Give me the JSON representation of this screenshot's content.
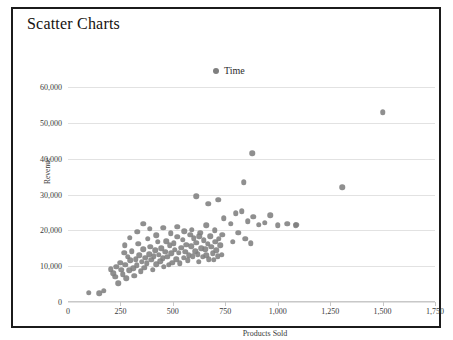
{
  "chart_panel": {
    "title": "Scatter Charts"
  },
  "legend": {
    "position": "top-center",
    "entries": [
      {
        "label": "Time",
        "color": "#7f7f7f"
      }
    ]
  },
  "chart_data": {
    "type": "scatter",
    "title": "Scatter Charts",
    "xlabel": "Products Sold",
    "ylabel": "Revenue",
    "xlim": [
      0,
      1750
    ],
    "ylim": [
      0,
      62000
    ],
    "xticks": [
      0,
      250,
      500,
      750,
      1000,
      1250,
      1500,
      1750
    ],
    "xticklabels": [
      "0",
      "250",
      "500",
      "750",
      "1,000",
      "1,250",
      "1,500",
      "1,750"
    ],
    "yticks": [
      0,
      10000,
      20000,
      30000,
      40000,
      50000,
      60000
    ],
    "yticklabels": [
      "0",
      "10,000",
      "20,000",
      "30,000",
      "40,000",
      "50,000",
      "60,000"
    ],
    "grid": "horizontal",
    "marker_color": "#808080",
    "series": [
      {
        "name": "Time",
        "points": [
          [
            100,
            2600
          ],
          [
            150,
            2400
          ],
          [
            170,
            3100
          ],
          [
            205,
            9200
          ],
          [
            215,
            8000
          ],
          [
            225,
            7000
          ],
          [
            230,
            9800
          ],
          [
            240,
            5200
          ],
          [
            248,
            11000
          ],
          [
            255,
            9000
          ],
          [
            262,
            7800
          ],
          [
            268,
            13800
          ],
          [
            272,
            10400
          ],
          [
            278,
            6600
          ],
          [
            285,
            12600
          ],
          [
            292,
            8800
          ],
          [
            298,
            11600
          ],
          [
            305,
            14200
          ],
          [
            310,
            9400
          ],
          [
            316,
            7400
          ],
          [
            322,
            12000
          ],
          [
            328,
            10200
          ],
          [
            334,
            16200
          ],
          [
            340,
            13000
          ],
          [
            346,
            8600
          ],
          [
            352,
            11200
          ],
          [
            358,
            14800
          ],
          [
            363,
            9600
          ],
          [
            369,
            12400
          ],
          [
            375,
            10800
          ],
          [
            381,
            17600
          ],
          [
            387,
            13400
          ],
          [
            392,
            15400
          ],
          [
            398,
            11800
          ],
          [
            404,
            9000
          ],
          [
            410,
            12800
          ],
          [
            416,
            14400
          ],
          [
            421,
            10600
          ],
          [
            427,
            16800
          ],
          [
            433,
            13200
          ],
          [
            439,
            11400
          ],
          [
            445,
            15000
          ],
          [
            451,
            12200
          ],
          [
            457,
            9800
          ],
          [
            463,
            14000
          ],
          [
            468,
            17000
          ],
          [
            474,
            12600
          ],
          [
            480,
            10400
          ],
          [
            486,
            15800
          ],
          [
            492,
            13600
          ],
          [
            498,
            11000
          ],
          [
            504,
            16400
          ],
          [
            510,
            14600
          ],
          [
            516,
            12000
          ],
          [
            522,
            18200
          ],
          [
            528,
            13800
          ],
          [
            534,
            10800
          ],
          [
            540,
            15200
          ],
          [
            546,
            17400
          ],
          [
            552,
            12400
          ],
          [
            558,
            14000
          ],
          [
            564,
            16000
          ],
          [
            570,
            11600
          ],
          [
            576,
            13000
          ],
          [
            582,
            18800
          ],
          [
            588,
            15600
          ],
          [
            594,
            12800
          ],
          [
            600,
            17800
          ],
          [
            606,
            14200
          ],
          [
            612,
            16600
          ],
          [
            618,
            13400
          ],
          [
            624,
            11200
          ],
          [
            630,
            19400
          ],
          [
            636,
            15000
          ],
          [
            642,
            12600
          ],
          [
            648,
            17200
          ],
          [
            654,
            14800
          ],
          [
            660,
            13000
          ],
          [
            666,
            16200
          ],
          [
            672,
            12000
          ],
          [
            678,
            18400
          ],
          [
            684,
            15400
          ],
          [
            690,
            13600
          ],
          [
            696,
            11800
          ],
          [
            702,
            16800
          ],
          [
            708,
            14400
          ],
          [
            714,
            12800
          ],
          [
            720,
            17600
          ],
          [
            726,
            15800
          ],
          [
            732,
            13200
          ],
          [
            270,
            15800
          ],
          [
            295,
            18000
          ],
          [
            330,
            19600
          ],
          [
            360,
            21800
          ],
          [
            390,
            20400
          ],
          [
            420,
            18600
          ],
          [
            455,
            20800
          ],
          [
            490,
            19200
          ],
          [
            520,
            21000
          ],
          [
            555,
            19800
          ],
          [
            590,
            20200
          ],
          [
            625,
            18400
          ],
          [
            660,
            21400
          ],
          [
            700,
            20000
          ],
          [
            735,
            18800
          ],
          [
            612,
            29600
          ],
          [
            668,
            27400
          ],
          [
            716,
            28600
          ],
          [
            742,
            23400
          ],
          [
            776,
            21800
          ],
          [
            800,
            24800
          ],
          [
            828,
            25400
          ],
          [
            856,
            22600
          ],
          [
            884,
            23800
          ],
          [
            910,
            21600
          ],
          [
            938,
            22200
          ],
          [
            964,
            24200
          ],
          [
            1000,
            21400
          ],
          [
            1046,
            21800
          ],
          [
            1088,
            21600
          ],
          [
            786,
            16800
          ],
          [
            812,
            19400
          ],
          [
            846,
            17600
          ],
          [
            872,
            16400
          ],
          [
            838,
            33400
          ],
          [
            878,
            41600
          ],
          [
            1085,
            21500
          ],
          [
            1308,
            32000
          ],
          [
            1500,
            53000
          ]
        ]
      }
    ]
  }
}
